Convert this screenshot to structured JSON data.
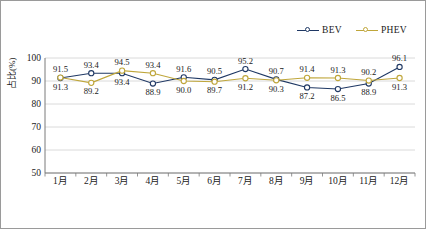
{
  "chart_data": {
    "type": "line",
    "title": "",
    "xlabel": "",
    "ylabel": "占比(%)",
    "categories": [
      "1月",
      "2月",
      "3月",
      "4月",
      "5月",
      "6月",
      "7月",
      "8月",
      "9月",
      "10月",
      "11月",
      "12月"
    ],
    "ylim": [
      50,
      100
    ],
    "yticks": [
      50,
      60,
      70,
      80,
      90,
      100
    ],
    "grid": true,
    "legend_position": "top-right",
    "series": [
      {
        "name": "BEV",
        "color": "#1F3864",
        "marker": "circle-open",
        "values": [
          91.3,
          93.4,
          93.4,
          88.9,
          91.6,
          90.5,
          95.2,
          90.7,
          87.2,
          86.5,
          88.9,
          96.1
        ]
      },
      {
        "name": "PHEV",
        "color": "#BFA63A",
        "marker": "circle-open",
        "values": [
          91.5,
          89.2,
          94.5,
          93.4,
          90.0,
          89.7,
          91.2,
          90.3,
          91.4,
          91.3,
          90.2,
          91.3
        ]
      }
    ],
    "data_labels": {
      "BEV": [
        "91.3",
        "93.4",
        "93.4",
        "88.9",
        "91.6",
        "90.5",
        "95.2",
        "90.7",
        "87.2",
        "86.5",
        "88.9",
        "96.1"
      ],
      "PHEV": [
        "91.5",
        "89.2",
        "94.5",
        "93.4",
        "90.0",
        "89.7",
        "91.2",
        "90.3",
        "91.4",
        "91.3",
        "90.2",
        "91.3"
      ]
    }
  },
  "legend": {
    "items": [
      {
        "label": "BEV",
        "color": "#1F3864"
      },
      {
        "label": "PHEV",
        "color": "#BFA63A"
      }
    ]
  },
  "axis": {
    "y_title": "占比(%)",
    "y_tick_labels": [
      "100",
      "90",
      "80",
      "70",
      "60",
      "50"
    ],
    "x_tick_labels": [
      "1月",
      "2月",
      "3月",
      "4月",
      "5月",
      "6月",
      "7月",
      "8月",
      "9月",
      "10月",
      "11月",
      "12月"
    ]
  }
}
